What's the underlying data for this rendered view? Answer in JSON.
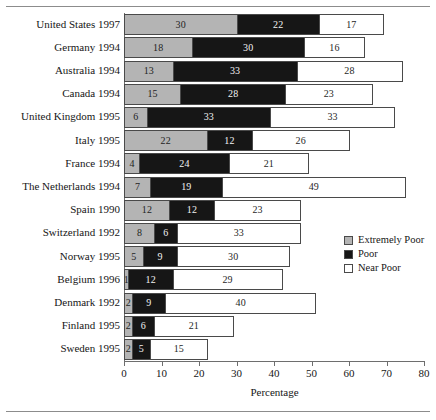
{
  "chart_data": {
    "type": "bar",
    "orientation": "horizontal",
    "stacked": true,
    "title": "",
    "xlabel": "Percentage",
    "ylabel": "",
    "xlim": [
      0,
      80
    ],
    "xticks": [
      0,
      10,
      20,
      30,
      40,
      50,
      60,
      70,
      80
    ],
    "grid": false,
    "legend_position": "right-middle",
    "categories": [
      "United States 1997",
      "Germany 1994",
      "Australia 1994",
      "Canada 1994",
      "United Kingdom 1995",
      "Italy 1995",
      "France 1994",
      "The Netherlands 1994",
      "Spain 1990",
      "Switzerland 1992",
      "Norway 1995",
      "Belgium 1996",
      "Denmark 1992",
      "Finland 1995",
      "Sweden 1995"
    ],
    "series": [
      {
        "name": "Extremely Poor",
        "color": "#b4b4b4",
        "values": [
          30,
          18,
          13,
          15,
          6,
          22,
          4,
          7,
          12,
          8,
          5,
          1,
          2,
          2,
          2
        ]
      },
      {
        "name": "Poor",
        "color": "#161616",
        "values": [
          22,
          30,
          33,
          28,
          33,
          12,
          24,
          19,
          12,
          6,
          9,
          12,
          9,
          6,
          5
        ]
      },
      {
        "name": "Near Poor",
        "color": "#ffffff",
        "values": [
          17,
          16,
          28,
          23,
          33,
          26,
          21,
          49,
          23,
          33,
          30,
          29,
          40,
          21,
          15
        ]
      }
    ]
  },
  "legend": {
    "items": [
      {
        "label": "Extremely Poor",
        "key": "extreme"
      },
      {
        "label": "Poor",
        "key": "poor"
      },
      {
        "label": "Near Poor",
        "key": "near"
      }
    ]
  },
  "axis": {
    "x_title": "Percentage"
  }
}
